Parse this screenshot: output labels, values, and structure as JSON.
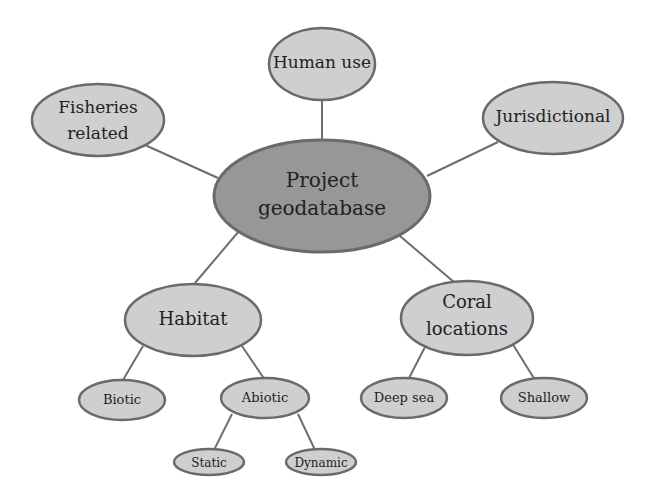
{
  "diagram": {
    "type": "mind-map",
    "colors": {
      "background": "#ffffff",
      "root_fill": "#979797",
      "node_fill": "#cfcfcf",
      "outline": "#6a6a6a",
      "edge": "#6e6e6e",
      "text": "#222222"
    },
    "nodes": {
      "root": {
        "line1": "Project",
        "line2": "geodatabase"
      },
      "human_use": {
        "label": "Human use"
      },
      "fisheries": {
        "line1": "Fisheries",
        "line2": "related"
      },
      "jurisdictional": {
        "label": "Jurisdictional"
      },
      "habitat": {
        "label": "Habitat"
      },
      "coral": {
        "line1": "Coral",
        "line2": "locations"
      },
      "biotic": {
        "label": "Biotic"
      },
      "abiotic": {
        "label": "Abiotic"
      },
      "static": {
        "label": "Static"
      },
      "dynamic": {
        "label": "Dynamic"
      },
      "deep_sea": {
        "label": "Deep sea"
      },
      "shallow": {
        "label": "Shallow"
      }
    },
    "edges": [
      [
        "root",
        "human_use"
      ],
      [
        "root",
        "fisheries"
      ],
      [
        "root",
        "jurisdictional"
      ],
      [
        "root",
        "habitat"
      ],
      [
        "root",
        "coral"
      ],
      [
        "habitat",
        "biotic"
      ],
      [
        "habitat",
        "abiotic"
      ],
      [
        "abiotic",
        "static"
      ],
      [
        "abiotic",
        "dynamic"
      ],
      [
        "coral",
        "deep_sea"
      ],
      [
        "coral",
        "shallow"
      ]
    ]
  }
}
